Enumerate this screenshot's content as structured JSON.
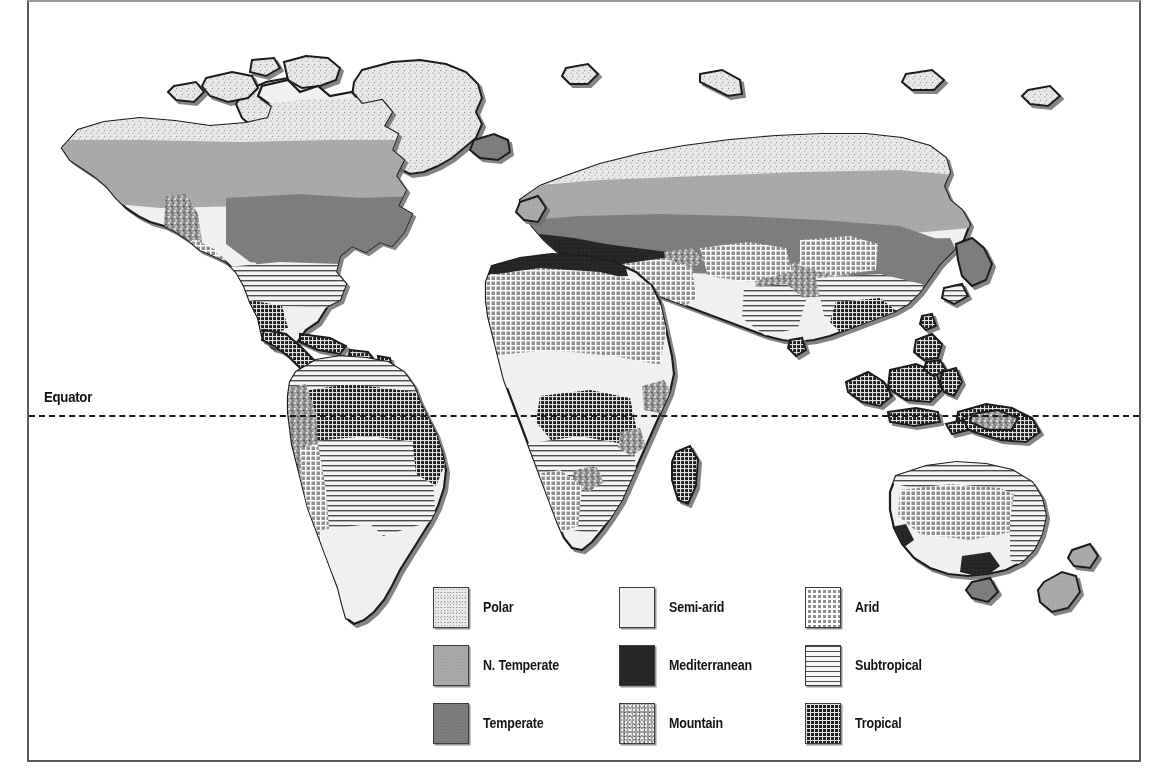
{
  "figure": {
    "kind": "world-climate-zones-map",
    "background_color": "#ffffff",
    "frame_color": "#5a5a5a"
  },
  "equator": {
    "label": "Equator",
    "line_style": "dashed",
    "line_color": "#1a1a1a",
    "y_px": 415
  },
  "legend": {
    "columns": 3,
    "rows": 3,
    "entries": [
      {
        "id": "polar",
        "label": "Polar",
        "pattern": "light-speckle",
        "color": "#e9e9e9",
        "column": 1,
        "row": 1
      },
      {
        "id": "semi-arid",
        "label": "Semi-arid",
        "pattern": "solid-very-light",
        "color": "#f0f0f0",
        "column": 2,
        "row": 1
      },
      {
        "id": "arid",
        "label": "Arid",
        "pattern": "white-grid-on-gray",
        "color": "#8f8f8f",
        "column": 3,
        "row": 1
      },
      {
        "id": "n-temperate",
        "label": "N. Temperate",
        "pattern": "solid-mid-gray",
        "color": "#a9a9a9",
        "column": 1,
        "row": 2
      },
      {
        "id": "mediterranean",
        "label": "Mediterranean",
        "pattern": "solid-near-black",
        "color": "#262626",
        "column": 2,
        "row": 2
      },
      {
        "id": "subtropical",
        "label": "Subtropical",
        "pattern": "horizontal-lines",
        "color": "#f2f2f2",
        "column": 3,
        "row": 2
      },
      {
        "id": "temperate",
        "label": "Temperate",
        "pattern": "solid-dark-gray",
        "color": "#7d7d7d",
        "column": 1,
        "row": 3
      },
      {
        "id": "mountain",
        "label": "Mountain",
        "pattern": "coarse-speckle",
        "color": "#9a9a9a",
        "column": 2,
        "row": 3
      },
      {
        "id": "tropical",
        "label": "Tropical",
        "pattern": "dark-crosshatch",
        "color": "#1f1f1f",
        "column": 3,
        "row": 3
      }
    ]
  },
  "map": {
    "projection": "world-equirectangular",
    "landmasses": [
      "North America",
      "Greenland",
      "Canadian Arctic Archipelago",
      "South America",
      "Europe",
      "Africa",
      "Madagascar",
      "Asia",
      "Japan",
      "Indonesia",
      "Philippines",
      "New Guinea",
      "Australia",
      "New Zealand",
      "Iceland",
      "British Isles",
      "Sri Lanka",
      "Caribbean",
      "Central America"
    ],
    "zone_notes": [
      {
        "region": "Arctic Canada, Greenland, northern Siberia",
        "zone": "polar"
      },
      {
        "region": "Boreal Canada, northern Europe, Siberia",
        "zone": "n-temperate"
      },
      {
        "region": "Northeast USA, eastern Europe, northeast China, New Zealand",
        "zone": "temperate"
      },
      {
        "region": "Great Plains, Central Asia, Sahel, inland Australia",
        "zone": "semi-arid"
      },
      {
        "region": "Mediterranean basin coastlines, southern Australia",
        "zone": "mediterranean"
      },
      {
        "region": "Rocky Mountains, Andes, Himalayas, East African highlands",
        "zone": "mountain"
      },
      {
        "region": "Southwest USA, Sahara, Arabia, Gobi, central Australia",
        "zone": "arid"
      },
      {
        "region": "Southeast USA, southern Brazil, southern Africa, southern China",
        "zone": "subtropical"
      },
      {
        "region": "Amazon, Congo, Indonesia, Central America, New Guinea",
        "zone": "tropical"
      }
    ]
  }
}
